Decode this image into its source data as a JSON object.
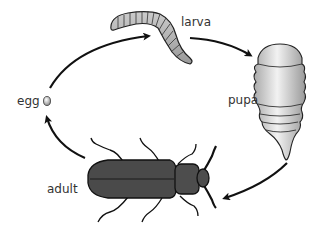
{
  "diagram": {
    "stages": [
      {
        "id": "egg",
        "label": "egg"
      },
      {
        "id": "larva",
        "label": "larva"
      },
      {
        "id": "pupa",
        "label": "pupa"
      },
      {
        "id": "adult",
        "label": "adult"
      }
    ],
    "arrows": [
      {
        "from": "egg",
        "to": "larva"
      },
      {
        "from": "larva",
        "to": "pupa"
      },
      {
        "from": "pupa",
        "to": "adult"
      },
      {
        "from": "adult",
        "to": "egg"
      }
    ],
    "colors": {
      "arrow": "#111111",
      "larva_fill": "#b5b5b5",
      "pupa_fill": "#d8d8d8",
      "adult_fill": "#4a4a4a",
      "text": "#333333"
    }
  }
}
